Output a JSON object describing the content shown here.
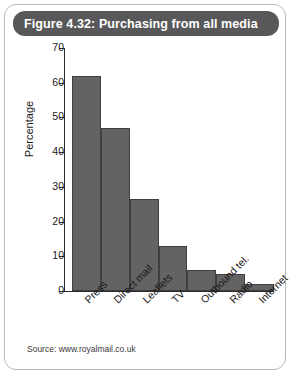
{
  "figure": {
    "title": "Figure 4.32: Purchasing from all media",
    "source": "Source: www.royalmail.co.uk",
    "title_bar_color": "#58585a",
    "bar_color": "#636363",
    "frame_color": "#b9b9b9"
  },
  "chart_data": {
    "type": "bar",
    "title": "Figure 4.32: Purchasing from all media",
    "categories": [
      "Press",
      "Direct mail",
      "Leaflets",
      "TV",
      "Outbound tel.",
      "Radio",
      "Internet"
    ],
    "values": [
      62,
      47,
      26.5,
      13,
      6,
      5,
      2
    ],
    "xlabel": "",
    "ylabel": "Percentage",
    "ylim": [
      0,
      70
    ],
    "yticks": [
      0,
      10,
      20,
      30,
      40,
      50,
      60,
      70
    ],
    "grid": false,
    "legend": false,
    "series": [
      {
        "name": "Purchasing from all media",
        "values": [
          62,
          47,
          26.5,
          13,
          6,
          5,
          2
        ]
      }
    ]
  }
}
